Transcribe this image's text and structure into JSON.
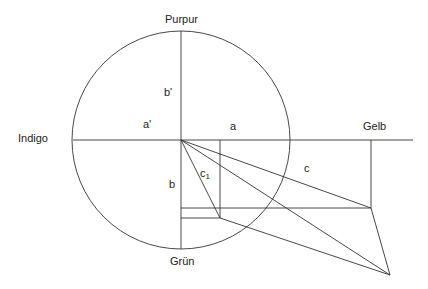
{
  "diagram": {
    "title": "",
    "labels": {
      "top": "Purpur",
      "left": "Indigo",
      "right": "Gelb",
      "bottom": "Grün",
      "a_prime": "a'",
      "b_prime": "b'",
      "a": "a",
      "b": "b",
      "c": "c",
      "c1_base": "c",
      "c1_sub": "1"
    },
    "geometry": {
      "center": [
        181,
        140
      ],
      "radius": 109,
      "axis_x_range": [
        73,
        413
      ],
      "points": {
        "origin": [
          181,
          140
        ],
        "a_foot": [
          220,
          140
        ],
        "gelb_foot": [
          371,
          140
        ],
        "p_c": [
          371,
          208
        ],
        "p_c1": [
          220,
          218
        ],
        "p_far": [
          390,
          275
        ],
        "b_upper": [
          181,
          208
        ],
        "b_lower": [
          181,
          218
        ]
      }
    },
    "colors": {
      "line": "#333333",
      "text": "#222222",
      "background": "#ffffff"
    }
  }
}
